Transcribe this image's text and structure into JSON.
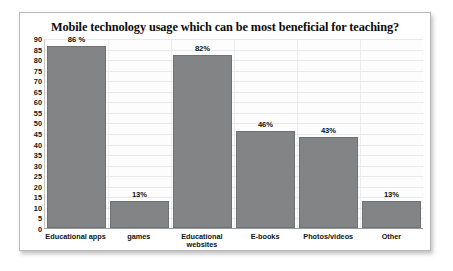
{
  "chart_data": {
    "type": "bar",
    "title": "Mobile technology usage which can be most beneficial for teaching?",
    "categories": [
      "Educational apps",
      "games",
      "Educational websites",
      "E-books",
      "Photos/videos",
      "Other"
    ],
    "values": [
      86,
      13,
      82,
      46,
      43,
      13
    ],
    "data_labels": [
      "86 %",
      "13%",
      "82%",
      "46%",
      "43%",
      "13%"
    ],
    "xlabel": "",
    "ylabel": "",
    "ylim": [
      0,
      90
    ],
    "ytick_step": 5,
    "yticks": [
      90,
      85,
      80,
      75,
      70,
      65,
      60,
      55,
      50,
      45,
      40,
      35,
      30,
      25,
      20,
      15,
      10,
      5,
      0
    ],
    "grid": true,
    "legend": false,
    "series_color": "#828486",
    "frame_color": "#b8b8b8",
    "background": "#ffffff"
  }
}
